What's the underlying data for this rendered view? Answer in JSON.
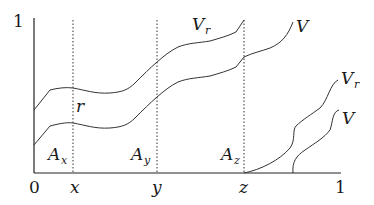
{
  "diagram": {
    "y_axis_top_label": "1",
    "x_axis": {
      "origin_label": "0",
      "tick_labels": [
        "x",
        "y",
        "z"
      ],
      "end_label": "1"
    },
    "dotted_line_labels": {
      "r": "r"
    },
    "region_labels": {
      "A_x": {
        "base": "A",
        "sub": "x"
      },
      "A_y": {
        "base": "A",
        "sub": "y"
      },
      "A_z": {
        "base": "A",
        "sub": "z"
      }
    },
    "curve_labels": {
      "upper_left_Vr": {
        "base": "V",
        "sub": "r"
      },
      "upper_left_V": {
        "base": "V",
        "sub": ""
      },
      "right_Vr": {
        "base": "V",
        "sub": "r"
      },
      "right_V": {
        "base": "V",
        "sub": ""
      }
    },
    "colors": {
      "stroke": "#333333",
      "background": "#ffffff"
    }
  }
}
